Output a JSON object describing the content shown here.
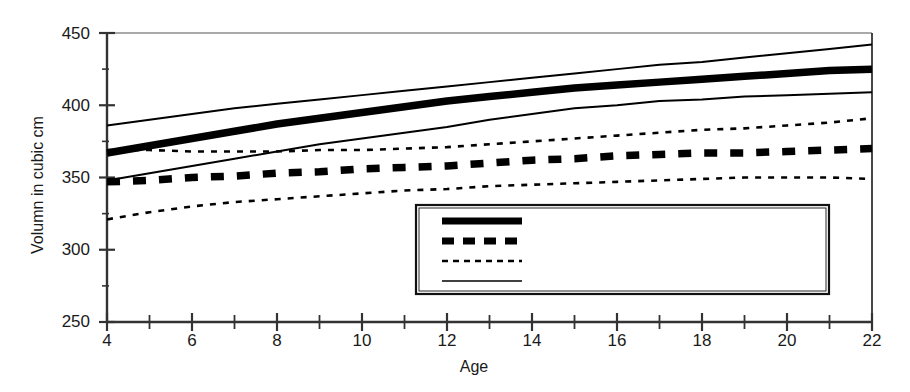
{
  "chart_data": {
    "type": "line",
    "title": "",
    "xlabel": "Age",
    "ylabel": "Volumn in cubic cm",
    "xlim": [
      4,
      22
    ],
    "ylim": [
      250,
      450
    ],
    "xticks": [
      4,
      6,
      8,
      10,
      12,
      14,
      16,
      18,
      20,
      22
    ],
    "xtick_labels": [
      "4",
      "6",
      "8",
      "10",
      "12",
      "14",
      "16",
      "18",
      "20",
      "22"
    ],
    "x_minor_tick_step": 1,
    "yticks": [
      250,
      300,
      350,
      400,
      450
    ],
    "ytick_labels": [
      "250",
      "300",
      "350",
      "400",
      "450"
    ],
    "y_minor_tick_step": 25,
    "grid": false,
    "legend_position": "lower right inside plot",
    "x": [
      4,
      5,
      6,
      7,
      8,
      9,
      10,
      11,
      12,
      13,
      14,
      15,
      16,
      17,
      18,
      19,
      20,
      21,
      22
    ],
    "series": [
      {
        "name": "Male (152 scans from 90 subjects)",
        "style": "thick-solid",
        "color": "#000000",
        "values": [
          367,
          372,
          377,
          382,
          387,
          391,
          395,
          399,
          403,
          406,
          409,
          412,
          414,
          416,
          418,
          420,
          422,
          424,
          425
        ]
      },
      {
        "name": "Female (91 scans from 55 subjects)",
        "style": "thick-dashed",
        "color": "#000000",
        "values": [
          347,
          348,
          350,
          351,
          353,
          354,
          356,
          357,
          358,
          360,
          362,
          363,
          365,
          366,
          367,
          367,
          368,
          369,
          370
        ]
      },
      {
        "name": "95% confidence interval-female",
        "style": "thin-dotted",
        "color": "#000000",
        "bound": "upper",
        "values": [
          369,
          369,
          368,
          368,
          368,
          369,
          369,
          370,
          371,
          373,
          375,
          377,
          379,
          381,
          383,
          384,
          386,
          388,
          391
        ]
      },
      {
        "name": "95% confidence interval-female",
        "style": "thin-dotted",
        "color": "#000000",
        "bound": "lower",
        "values": [
          321,
          326,
          330,
          333,
          335,
          337,
          339,
          341,
          342,
          344,
          345,
          346,
          347,
          348,
          349,
          350,
          350,
          350,
          349
        ]
      },
      {
        "name": "95% confidence interval–male",
        "style": "thin-solid",
        "color": "#000000",
        "bound": "upper",
        "values": [
          386,
          390,
          394,
          398,
          401,
          404,
          407,
          410,
          413,
          416,
          419,
          422,
          425,
          428,
          430,
          433,
          436,
          439,
          442
        ]
      },
      {
        "name": "95% confidence interval–male",
        "style": "thin-solid",
        "color": "#000000",
        "bound": "lower",
        "values": [
          348,
          353,
          358,
          363,
          368,
          373,
          377,
          381,
          385,
          390,
          394,
          398,
          400,
          403,
          404,
          406,
          407,
          408,
          409
        ]
      }
    ],
    "legend_entries": [
      {
        "label": "Male (152 scans from 90 subjects)",
        "style": "thick-solid"
      },
      {
        "label": "Female (91 scans from 55 subjects)",
        "style": "thick-dashed"
      },
      {
        "label": "95% confidence interval-female",
        "style": "thin-dotted"
      },
      {
        "label": "95% confidence interval–male",
        "style": "thin-solid"
      }
    ]
  }
}
